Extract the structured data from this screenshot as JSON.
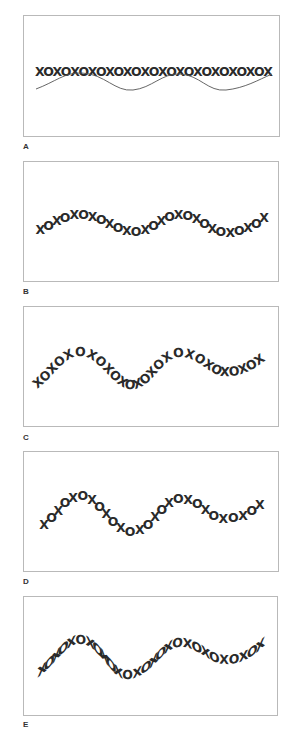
{
  "figure": {
    "text": "XOXOXOXOXOXOXOXOXOXOXOXOXOX",
    "text_color": "#2a2a2a",
    "border_color": "#b9b9b9",
    "panels": [
      {
        "label": "A",
        "mode": "flat-with-guide-path",
        "box": {
          "x": 23,
          "y": 15,
          "w": 257,
          "h": 122
        },
        "text_baseline": {
          "x": 36,
          "y": 76
        },
        "path": "M 36 89 C 55 82, 65 72, 82 73 C 105 74, 115 92, 133 90 C 152 88, 162 73, 180 74 C 200 75, 208 92, 226 90 C 245 88, 258 80, 272 74"
      },
      {
        "label": "B",
        "mode": "baseline-only",
        "box": {
          "x": 23,
          "y": 161,
          "w": 256,
          "h": 121
        },
        "path": "M 36 236 C 55 228, 62 219, 80 219 C 105 219, 112 236, 135 236 C 155 236, 160 219, 180 219 C 202 219, 208 237, 226 237 C 245 237, 255 228, 268 220"
      },
      {
        "label": "C",
        "mode": "rotate",
        "box": {
          "x": 23,
          "y": 306,
          "w": 256,
          "h": 121
        },
        "path": "M 37 389 C 55 375, 65 356, 80 356 C 100 356, 112 389, 132 389 C 152 389, 162 357, 180 357 C 200 357, 208 376, 226 376 C 245 376, 255 368, 266 360"
      },
      {
        "label": "D",
        "mode": "vertical-upright",
        "box": {
          "x": 23,
          "y": 451,
          "w": 256,
          "h": 121
        },
        "path": "M 40 532 C 58 520, 65 500, 80 500 C 100 500, 112 536, 132 536 C 152 536, 162 503, 180 503 C 200 503, 208 523, 226 523 C 245 523, 255 512, 264 506"
      },
      {
        "label": "E",
        "mode": "skew",
        "box": {
          "x": 23,
          "y": 596,
          "w": 255,
          "h": 120
        },
        "path": "M 38 677 C 55 665, 65 644, 80 644 C 100 644, 110 679, 127 679 C 150 679, 162 647, 180 647 C 200 647, 208 664, 226 664 C 245 664, 255 654, 264 646"
      }
    ],
    "labels": {
      "A": 146,
      "B": 291,
      "C": 437,
      "D": 581,
      "E": 725
    }
  }
}
